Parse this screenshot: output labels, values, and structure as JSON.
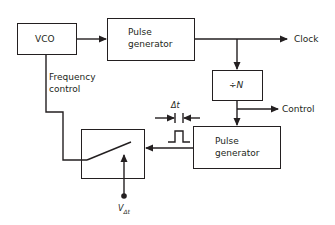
{
  "diagram": {
    "blocks": {
      "vco": {
        "label": "VCO"
      },
      "pulse_gen_1": {
        "line1": "Pulse",
        "line2": "generator"
      },
      "divider": {
        "label": "÷N"
      },
      "pulse_gen_2": {
        "line1": "Pulse",
        "line2": "generator"
      },
      "switch": {
        "label": ""
      }
    },
    "signals": {
      "clock": "Clock",
      "control": "Control",
      "frequency_control_line1": "Frequency",
      "frequency_control_line2": "control",
      "delta_t": "Δt",
      "v_delta_t_main": "V",
      "v_delta_t_sub": "Δt"
    },
    "colors": {
      "stroke": "#231f20",
      "background": "#ffffff"
    }
  }
}
